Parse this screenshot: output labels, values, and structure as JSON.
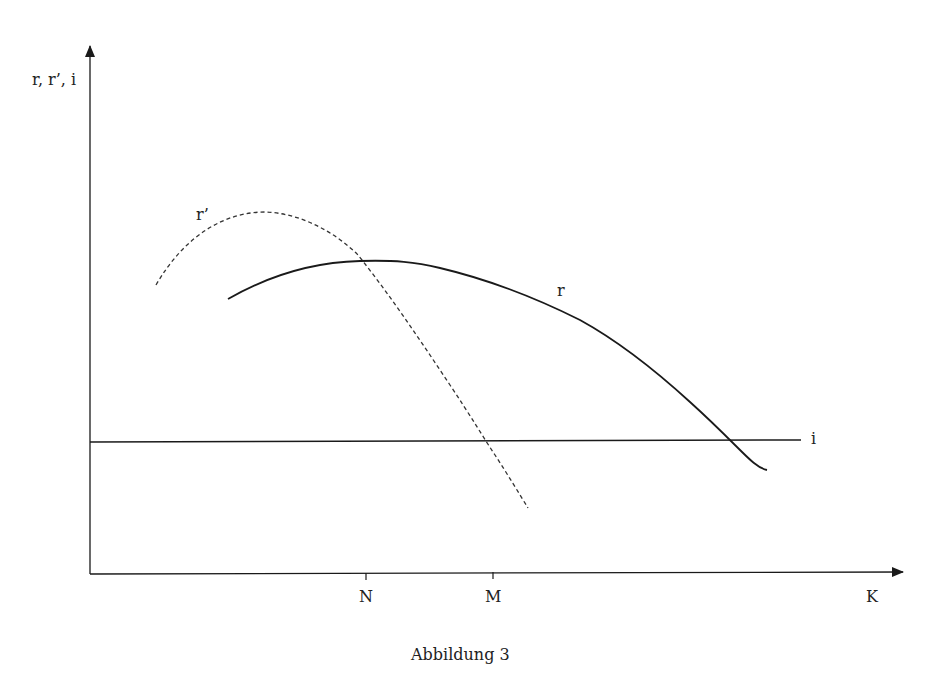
{
  "figure": {
    "caption": "Abbildung 3",
    "y_axis_label": "r, r’, i",
    "x_axis_label": "K",
    "x_ticks": [
      {
        "label": "N"
      },
      {
        "label": "M"
      }
    ],
    "curves": {
      "r": {
        "label": "r",
        "style": "solid"
      },
      "r_prime": {
        "label": "r’",
        "style": "dashed"
      },
      "i": {
        "label": "i",
        "style": "solid-horizontal"
      }
    },
    "colors": {
      "line": "#1a1a1a",
      "text": "#222222",
      "background": "#ffffff"
    }
  }
}
